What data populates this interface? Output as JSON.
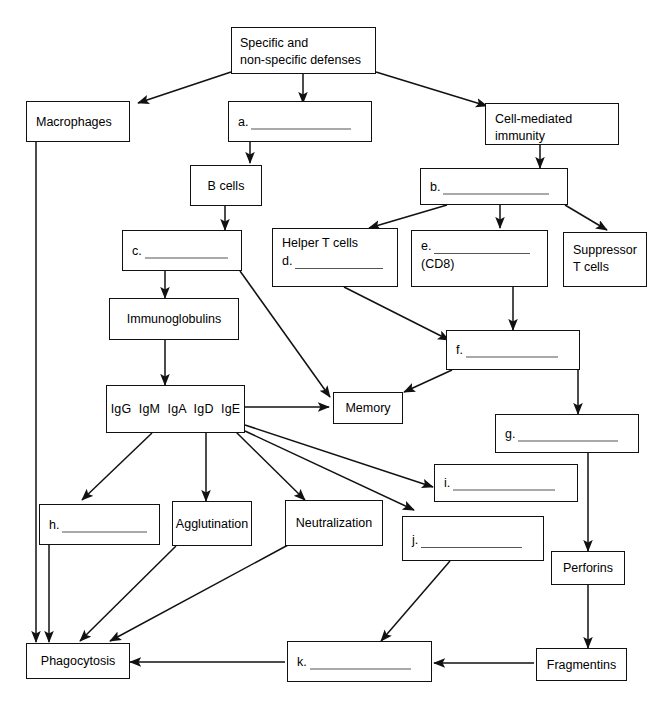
{
  "diagram": {
    "type": "flowchart",
    "stroke_color": "#111111",
    "rule_color": "#555555",
    "background": "#ffffff"
  },
  "nodes": {
    "root": {
      "line1": "Specific and",
      "line2": "non-specific defenses"
    },
    "macrophages": {
      "label": "Macrophages"
    },
    "a": {
      "key": "a.",
      "label": ""
    },
    "cell_mediated": {
      "line1": "Cell-mediated",
      "line2": "immunity"
    },
    "bcells": {
      "label": "B cells"
    },
    "b": {
      "key": "b.",
      "label": ""
    },
    "c": {
      "key": "c.",
      "label": ""
    },
    "helper_t": {
      "line1": "Helper T cells",
      "key": "d.",
      "label": ""
    },
    "e": {
      "key": "e.",
      "label": "",
      "sub": "(CD8)"
    },
    "suppressor_t": {
      "line1": "Suppressor",
      "line2": "T cells"
    },
    "immunoglobulins": {
      "label": "Immunoglobulins"
    },
    "f": {
      "key": "f.",
      "label": ""
    },
    "ig_classes": {
      "label": "IgG  IgM  IgA  IgD  IgE"
    },
    "memory": {
      "label": "Memory"
    },
    "g": {
      "key": "g.",
      "label": ""
    },
    "i": {
      "key": "i.",
      "label": ""
    },
    "h": {
      "key": "h.",
      "label": ""
    },
    "agglutination": {
      "label": "Agglutination"
    },
    "neutralization": {
      "label": "Neutralization"
    },
    "j": {
      "key": "j.",
      "label": ""
    },
    "perforins": {
      "label": "Perforins"
    },
    "phagocytosis": {
      "label": "Phagocytosis"
    },
    "k": {
      "key": "k.",
      "label": ""
    },
    "fragmentins": {
      "label": "Fragmentins"
    }
  },
  "blanks": [
    {
      "key": "a.",
      "answer": ""
    },
    {
      "key": "b.",
      "answer": ""
    },
    {
      "key": "c.",
      "answer": ""
    },
    {
      "key": "d.",
      "answer": ""
    },
    {
      "key": "e.",
      "answer": ""
    },
    {
      "key": "f.",
      "answer": ""
    },
    {
      "key": "g.",
      "answer": ""
    },
    {
      "key": "h.",
      "answer": ""
    },
    {
      "key": "i.",
      "answer": ""
    },
    {
      "key": "j.",
      "answer": ""
    },
    {
      "key": "k.",
      "answer": ""
    }
  ],
  "edges": [
    {
      "from": "root",
      "to": "macrophages",
      "arrow": true
    },
    {
      "from": "root",
      "to": "a",
      "arrow": true
    },
    {
      "from": "root",
      "to": "cell_mediated",
      "arrow": true
    },
    {
      "from": "a",
      "to": "bcells",
      "arrow": true
    },
    {
      "from": "cell_mediated",
      "to": "b",
      "arrow": true
    },
    {
      "from": "bcells",
      "to": "c",
      "arrow": true
    },
    {
      "from": "b",
      "to": "helper_t",
      "arrow": true
    },
    {
      "from": "b",
      "to": "e",
      "arrow": true
    },
    {
      "from": "b",
      "to": "suppressor_t",
      "arrow": true
    },
    {
      "from": "c",
      "to": "immunoglobulins",
      "arrow": true
    },
    {
      "from": "c",
      "to": "memory",
      "arrow": true
    },
    {
      "from": "helper_t",
      "to": "f",
      "arrow": true
    },
    {
      "from": "e",
      "to": "f",
      "arrow": true
    },
    {
      "from": "immunoglobulins",
      "to": "ig_classes",
      "arrow": true
    },
    {
      "from": "f",
      "to": "memory",
      "arrow": true
    },
    {
      "from": "f",
      "to": "g",
      "arrow": true
    },
    {
      "from": "ig_classes",
      "to": "memory",
      "arrow": true
    },
    {
      "from": "ig_classes",
      "to": "h",
      "arrow": true
    },
    {
      "from": "ig_classes",
      "to": "agglutination",
      "arrow": true
    },
    {
      "from": "ig_classes",
      "to": "neutralization",
      "arrow": true
    },
    {
      "from": "ig_classes",
      "to": "i",
      "arrow": true
    },
    {
      "from": "ig_classes",
      "to": "j",
      "arrow": true
    },
    {
      "from": "g",
      "to": "perforins",
      "arrow": true
    },
    {
      "from": "h",
      "to": "phagocytosis",
      "arrow": true
    },
    {
      "from": "agglutination",
      "to": "phagocytosis",
      "arrow": true
    },
    {
      "from": "neutralization",
      "to": "phagocytosis",
      "arrow": true
    },
    {
      "from": "macrophages",
      "to": "phagocytosis",
      "arrow": true
    },
    {
      "from": "j",
      "to": "k",
      "arrow": true
    },
    {
      "from": "perforins",
      "to": "fragmentins",
      "arrow": true
    },
    {
      "from": "fragmentins",
      "to": "k",
      "arrow": true
    },
    {
      "from": "k",
      "to": "phagocytosis",
      "arrow": true
    }
  ]
}
